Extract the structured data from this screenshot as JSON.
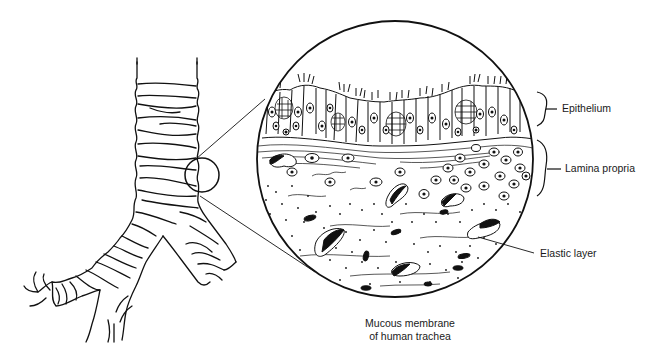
{
  "figure": {
    "title": "Mucous membrane of human trachea",
    "caption_line1": "Mucous membrane",
    "caption_line2": "of human trachea",
    "labels": {
      "epithelium": "Epithelium",
      "lamina_propria": "Lamina propria",
      "elastic_layer": "Elastic layer"
    },
    "parts": [
      "trachea",
      "bronchi",
      "magnified-circle",
      "epithelium-layer",
      "lamina-propria-layer",
      "elastic-layer"
    ],
    "colors": {
      "ink": "#111111",
      "background": "#ffffff"
    }
  }
}
